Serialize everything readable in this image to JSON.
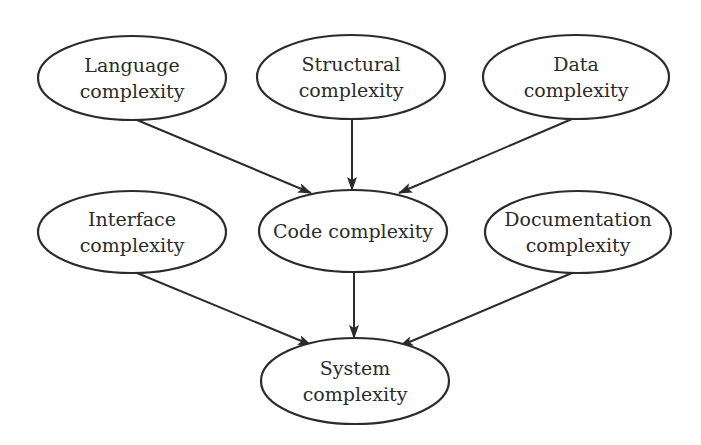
{
  "diagram": {
    "type": "directed-graph",
    "colors": {
      "stroke": "#2b2b2b",
      "background": "#ffffff",
      "text": "#2b2b2b"
    },
    "nodes": [
      {
        "id": "language",
        "lines": [
          "Language",
          "complexity"
        ],
        "cx": 132,
        "cy": 78,
        "rx": 94,
        "ry": 42
      },
      {
        "id": "structural",
        "lines": [
          "Structural",
          "complexity"
        ],
        "cx": 351,
        "cy": 77,
        "rx": 94,
        "ry": 42
      },
      {
        "id": "data",
        "lines": [
          "Data",
          "complexity"
        ],
        "cx": 576,
        "cy": 77,
        "rx": 93,
        "ry": 42
      },
      {
        "id": "interface",
        "lines": [
          "Interface",
          "complexity"
        ],
        "cx": 132,
        "cy": 232,
        "rx": 94,
        "ry": 41
      },
      {
        "id": "code",
        "lines": [
          "Code complexity"
        ],
        "cx": 353,
        "cy": 231,
        "rx": 94,
        "ry": 41
      },
      {
        "id": "documentation",
        "lines": [
          "Documentation",
          "complexity"
        ],
        "cx": 578,
        "cy": 232,
        "rx": 93,
        "ry": 41
      },
      {
        "id": "system",
        "lines": [
          "System",
          "complexity"
        ],
        "cx": 355,
        "cy": 381,
        "rx": 94,
        "ry": 43
      }
    ],
    "edges": [
      {
        "from": "language",
        "to": "code",
        "x1": 137,
        "y1": 120,
        "x2": 311,
        "y2": 193
      },
      {
        "from": "structural",
        "to": "code",
        "x1": 352,
        "y1": 119,
        "x2": 352,
        "y2": 190
      },
      {
        "from": "data",
        "to": "code",
        "x1": 572,
        "y1": 119,
        "x2": 399,
        "y2": 193
      },
      {
        "from": "interface",
        "to": "system",
        "x1": 137,
        "y1": 273,
        "x2": 311,
        "y2": 345
      },
      {
        "from": "code",
        "to": "system",
        "x1": 354,
        "y1": 272,
        "x2": 354,
        "y2": 338
      },
      {
        "from": "documentation",
        "to": "system",
        "x1": 572,
        "y1": 273,
        "x2": 400,
        "y2": 346
      }
    ]
  }
}
